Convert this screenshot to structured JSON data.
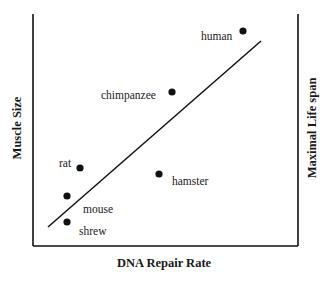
{
  "chart_data": {
    "type": "scatter",
    "title": "",
    "xlabel": "DNA Repair Rate",
    "ylabel": "Muscle Size",
    "ylabel_right": "Maximal Life span",
    "grid": false,
    "legend": null,
    "ticks": false,
    "points": [
      {
        "label": "human",
        "x": 243,
        "y": 31,
        "label_x": 201,
        "label_y": 40
      },
      {
        "label": "chimpanzee",
        "x": 172,
        "y": 92,
        "label_x": 101,
        "label_y": 99
      },
      {
        "label": "rat",
        "x": 80,
        "y": 168,
        "label_x": 59,
        "label_y": 167
      },
      {
        "label": "hamster",
        "x": 159,
        "y": 174,
        "label_x": 172,
        "label_y": 185
      },
      {
        "label": "mouse",
        "x": 67,
        "y": 196,
        "label_x": 83,
        "label_y": 213
      },
      {
        "label": "shrew",
        "x": 67,
        "y": 222,
        "label_x": 79,
        "label_y": 235
      }
    ],
    "trend_line": {
      "x1": 48,
      "y1": 227,
      "x2": 261,
      "y2": 41
    },
    "frame": {
      "left": 33,
      "right": 298,
      "top": 14,
      "bottom": 246
    },
    "colors": {
      "ink": "#111111",
      "background": "#ffffff"
    }
  }
}
